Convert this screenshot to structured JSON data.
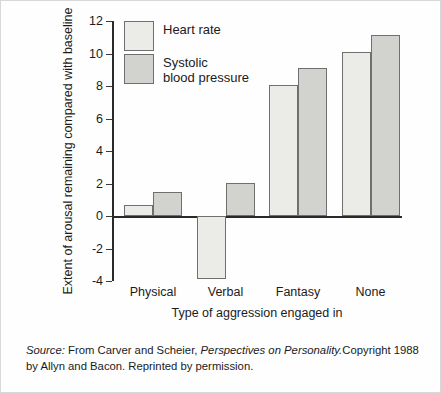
{
  "chart_data": {
    "type": "bar",
    "title": "",
    "subtitle": "",
    "categories": [
      "Physical",
      "Verbal",
      "Fantasy",
      "None"
    ],
    "series": [
      {
        "name": "Heart rate",
        "values": [
          0.7,
          -3.9,
          8.05,
          10.1
        ],
        "color": "#ebebe8"
      },
      {
        "name": "Systolic blood pressure",
        "values": [
          1.5,
          2.05,
          9.1,
          11.15
        ],
        "color": "#d2d2ce"
      }
    ],
    "xlabel": "Type of aggression engaged in",
    "ylabel": "Extent of arousal remaining compared with baseline",
    "ylim": [
      -4,
      12
    ],
    "yticks": [
      -4,
      -2,
      0,
      2,
      4,
      6,
      8,
      10,
      12
    ],
    "ytick_labels": [
      "-4",
      "-2",
      "0",
      "2",
      "4",
      "6",
      "8",
      "10",
      "12"
    ],
    "grid": false,
    "legend_position": "top-left",
    "zero_line": true
  },
  "axes": {
    "y_title": "Extent of arousal remaining compared with baseline",
    "x_title": "Type of aggression engaged in"
  },
  "legend": {
    "items": [
      {
        "label_line1": "Heart rate",
        "label_line2": ""
      },
      {
        "label_line1": "Systolic",
        "label_line2": "blood pressure"
      }
    ]
  },
  "source": {
    "label": "Source:",
    "text_before_title": " From Carver and Scheier, ",
    "title": "Perspectives on Personality.",
    "text_after_title": "Copyright 1988 by Allyn and Bacon. Reprinted by permission."
  }
}
